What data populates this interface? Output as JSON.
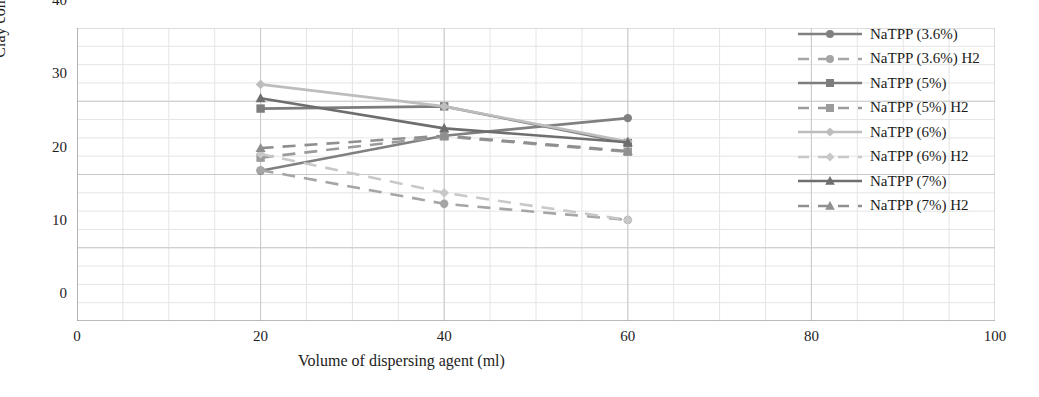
{
  "chart_data": {
    "type": "line",
    "title": "",
    "xlabel": "Volume of dispersing agent (ml)",
    "ylabel": "Clay content (%)",
    "x": [
      20,
      40,
      60
    ],
    "xlim": [
      0,
      100
    ],
    "ylim": [
      0,
      40
    ],
    "xticks": [
      "0",
      "20",
      "40",
      "60",
      "80",
      "100"
    ],
    "yticks": [
      "0",
      "10",
      "20",
      "30",
      "40"
    ],
    "grid": "major and minor gridlines, light grey",
    "legend_position": "right",
    "series": [
      {
        "name": "NaTPP (3.6%)",
        "values": [
          20.5,
          25.3,
          27.7
        ],
        "style": "solid",
        "marker": "circle",
        "color": "#808080"
      },
      {
        "name": "NaTPP (3.6%) H2",
        "values": [
          20.6,
          16.0,
          13.8
        ],
        "style": "dashed",
        "marker": "circle",
        "color": "#a5a5a5"
      },
      {
        "name": "NaTPP (5%)",
        "values": [
          29.0,
          29.3,
          24.3
        ],
        "style": "solid",
        "marker": "square",
        "color": "#7d7d7d"
      },
      {
        "name": "NaTPP (5%) H2",
        "values": [
          22.3,
          25.2,
          23.1
        ],
        "style": "dashed",
        "marker": "square",
        "color": "#9b9b9b"
      },
      {
        "name": "NaTPP (6%)",
        "values": [
          32.3,
          29.3,
          24.5
        ],
        "style": "solid",
        "marker": "diamond",
        "color": "#bdbdbd"
      },
      {
        "name": "NaTPP (6%) H2",
        "values": [
          22.8,
          17.5,
          13.8
        ],
        "style": "dashed",
        "marker": "diamond",
        "color": "#c8c8c8"
      },
      {
        "name": "NaTPP (7%)",
        "values": [
          30.4,
          26.3,
          24.4
        ],
        "style": "solid",
        "marker": "triangle",
        "color": "#6e6e6e"
      },
      {
        "name": "NaTPP (7%) H2",
        "values": [
          23.6,
          25.3,
          23.2
        ],
        "style": "dashed",
        "marker": "triangle",
        "color": "#8f8f8f"
      }
    ]
  },
  "axes": {
    "y_title": "Clay content (%)",
    "x_title": "Volume of dispersing agent (ml)",
    "y_ticks": [
      "40",
      "30",
      "20",
      "10",
      "0"
    ],
    "x_ticks": [
      "0",
      "20",
      "40",
      "60",
      "80",
      "100"
    ]
  },
  "legend": {
    "items": [
      {
        "label": "NaTPP (3.6%)"
      },
      {
        "label": "NaTPP (3.6%) H2"
      },
      {
        "label": "NaTPP (5%)"
      },
      {
        "label": "NaTPP (5%) H2"
      },
      {
        "label": "NaTPP (6%)"
      },
      {
        "label": "NaTPP (6%) H2"
      },
      {
        "label": "NaTPP (7%)"
      },
      {
        "label": "NaTPP (7%) H2"
      }
    ]
  },
  "colors": {
    "grid_major": "#c9c9c9",
    "grid_minor": "#e4e4e4",
    "axis": "#9a9a9a",
    "text": "#1c1c1c"
  }
}
